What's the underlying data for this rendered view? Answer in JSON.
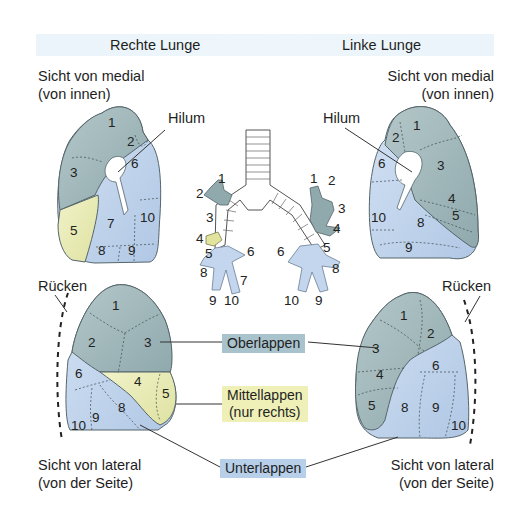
{
  "header": {
    "right_lung_title": "Rechte Lunge",
    "left_lung_title": "Linke Lunge"
  },
  "views": {
    "medial_right_line1": "Sicht von medial",
    "medial_right_line2": "(von innen)",
    "medial_left_line1": "Sicht von medial",
    "medial_left_line2": "(von innen)",
    "lateral_right_line1": "Sicht von lateral",
    "lateral_right_line2": "(von der Seite)",
    "lateral_left_line1": "Sicht von lateral",
    "lateral_left_line2": "(von der Seite)"
  },
  "annotations": {
    "hilum_right": "Hilum",
    "hilum_left": "Hilum",
    "back_right": "Rücken",
    "back_left": "Rücken"
  },
  "lobes": {
    "upper": {
      "label": "Oberlappen",
      "color": "#a9c3cc"
    },
    "middle_line1": "Mittellappen",
    "middle_line2": "(nur rechts)",
    "middle_color": "#eef0b8",
    "lower": {
      "label": "Unterlappen",
      "color": "#b7cfe9"
    }
  },
  "segments": {
    "right_medial": [
      "1",
      "2",
      "3",
      "5",
      "6",
      "7",
      "8",
      "9",
      "10"
    ],
    "left_medial": [
      "1",
      "2",
      "3",
      "4",
      "5",
      "6",
      "8",
      "9",
      "10"
    ],
    "right_lateral": [
      "1",
      "2",
      "3",
      "4",
      "5",
      "6",
      "8",
      "9",
      "10"
    ],
    "left_lateral": [
      "1",
      "2",
      "3",
      "4",
      "5",
      "6",
      "8",
      "9",
      "10"
    ],
    "bronchi_right": [
      "1",
      "2",
      "3",
      "4",
      "5",
      "6",
      "7",
      "8",
      "9",
      "10"
    ],
    "bronchi_left": [
      "1",
      "2",
      "3",
      "4",
      "5",
      "6",
      "8",
      "9",
      "10"
    ]
  },
  "colors": {
    "upper_lobe": "#9fb7ba",
    "middle_lobe": "#eceeb4",
    "lower_lobe": "#c3d6ee",
    "outline": "#55656b"
  }
}
